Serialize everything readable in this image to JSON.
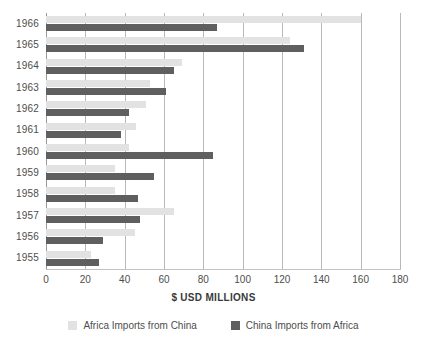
{
  "chart_data": {
    "type": "bar",
    "orientation": "horizontal",
    "title": "",
    "subtitle": "",
    "xlabel": "$ USD MILLIONS",
    "ylabel": "",
    "xlim": [
      0,
      180
    ],
    "ylim": null,
    "xticks": [
      0,
      20,
      40,
      60,
      80,
      100,
      120,
      140,
      160,
      180
    ],
    "xtick_labels": [
      "0",
      "20",
      "40",
      "60",
      "80",
      "100",
      "120",
      "140",
      "160",
      "180"
    ],
    "grid": "vertical",
    "legend_position": "bottom-center",
    "categories": [
      "1966",
      "1965",
      "1964",
      "1963",
      "1962",
      "1961",
      "1960",
      "1959",
      "1958",
      "1957",
      "1956",
      "1955"
    ],
    "series": [
      {
        "name": "Africa Imports from China",
        "color": "#e2e2e2",
        "values": [
          160,
          124,
          69,
          53,
          51,
          46,
          42,
          35,
          35,
          65,
          45,
          23
        ]
      },
      {
        "name": "China Imports from Africa",
        "color": "#5f5f5f",
        "values": [
          87,
          131,
          65,
          61,
          42,
          38,
          85,
          55,
          47,
          48,
          29,
          27
        ]
      }
    ],
    "annotations": []
  },
  "axis": {
    "x_title": "$ USD MILLIONS"
  },
  "legend": {
    "items": [
      {
        "label": "Africa Imports from China",
        "swatch": "light"
      },
      {
        "label": "China Imports from Africa",
        "swatch": "dark"
      }
    ]
  }
}
